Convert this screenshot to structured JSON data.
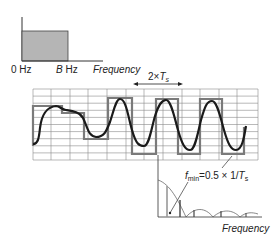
{
  "top_spectrum": {
    "label_zero": "0 Hz",
    "label_b_italic": "B",
    "label_b_unit": " Hz",
    "label_axis": "Frequency",
    "fill_color": "#b5b5b5"
  },
  "period_marker": {
    "label_prefix": "2×",
    "label_T": "T",
    "label_sub": "s"
  },
  "waveform": {
    "sampled_color": "#7a7a7a",
    "signal_color": "#1a1a1a",
    "grid_color": "#8a8a8a"
  },
  "bottom_spectrum": {
    "fmin_f": "f",
    "fmin_sub": "min",
    "fmin_expr": "=0.5 × 1/",
    "fmin_T": "T",
    "fmin_T_sub": "s",
    "label_axis": "Frequency"
  }
}
